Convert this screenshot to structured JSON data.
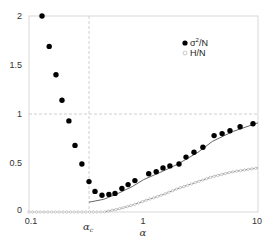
{
  "chart_data": {
    "type": "scatter",
    "title": "",
    "xlabel": "α",
    "ylabel": "",
    "xscale": "log",
    "xlim": [
      0.1,
      10
    ],
    "ylim": [
      0,
      2
    ],
    "x_ticks": [
      "0.1",
      "1",
      "10"
    ],
    "y_ticks": [
      "0",
      "0.5",
      "1",
      "1.5",
      "2"
    ],
    "grid": false,
    "legend_position": "upper right",
    "annotations": [
      {
        "text": "α_c",
        "type": "vertical-dashed-line",
        "x": 0.334
      },
      {
        "type": "horizontal-dashed-line",
        "y": 1
      }
    ],
    "series": [
      {
        "name": "σ²/N",
        "marker": "filled-circle",
        "color": "#000000",
        "x": [
          0.13,
          0.15,
          0.172,
          0.194,
          0.223,
          0.252,
          0.29,
          0.334,
          0.377,
          0.434,
          0.499,
          0.564,
          0.648,
          0.733,
          0.842,
          1.11,
          1.29,
          1.48,
          1.7,
          2.04,
          2.35,
          2.76,
          3.3,
          4.14,
          4.86,
          5.7,
          6.97,
          9.05
        ],
        "y": [
          2.0,
          1.69,
          1.4,
          1.14,
          0.93,
          0.68,
          0.49,
          0.31,
          0.21,
          0.17,
          0.18,
          0.19,
          0.24,
          0.28,
          0.32,
          0.39,
          0.41,
          0.45,
          0.47,
          0.49,
          0.56,
          0.61,
          0.66,
          0.78,
          0.8,
          0.83,
          0.87,
          0.9
        ]
      },
      {
        "name": "H/N",
        "marker": "open-circle",
        "color": "#aaaaaa",
        "x": [
          0.1,
          0.2,
          0.3,
          0.45,
          0.6,
          0.8,
          1.0,
          1.5,
          2.0,
          3.0,
          4.0,
          6.0,
          10.0
        ],
        "y": [
          0.0,
          0.0,
          0.0,
          0.0,
          0.03,
          0.07,
          0.11,
          0.18,
          0.24,
          0.31,
          0.36,
          0.41,
          0.45
        ]
      },
      {
        "name": "σ²/N theory",
        "marker": "line",
        "color": "#555555",
        "x": [
          0.334,
          0.45,
          0.6,
          0.8,
          1.0,
          1.5,
          2.0,
          3.0,
          4.0,
          6.0,
          10.0
        ],
        "y": [
          0.1,
          0.13,
          0.19,
          0.26,
          0.33,
          0.42,
          0.49,
          0.61,
          0.72,
          0.82,
          0.91
        ]
      },
      {
        "name": "H/N theory",
        "marker": "line",
        "color": "#777777",
        "x": [
          0.45,
          0.6,
          0.8,
          1.0,
          1.5,
          2.0,
          3.0,
          4.0,
          6.0,
          10.0
        ],
        "y": [
          0.0,
          0.03,
          0.07,
          0.11,
          0.18,
          0.24,
          0.31,
          0.36,
          0.41,
          0.45
        ]
      }
    ]
  },
  "labels": {
    "x_axis": "α",
    "alpha_c": "α",
    "alpha_c_sub": "c",
    "legend_sigma_main": "σ",
    "legend_sigma_sup": "2",
    "legend_sigma_rest": "/N",
    "legend_h": "H/N",
    "ytick_0": "0",
    "ytick_05": "0.5",
    "ytick_1": "1",
    "ytick_15": "1.5",
    "ytick_2": "2",
    "xtick_01": "0.1",
    "xtick_1": "1",
    "xtick_10": "10"
  }
}
